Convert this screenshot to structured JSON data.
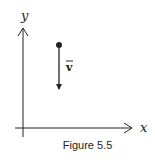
{
  "figure": {
    "caption": "Figure 5.5",
    "x_axis_label": "x",
    "y_axis_label": "y",
    "vector_label": "v",
    "vector_bar": "‾"
  },
  "colors": {
    "stroke": "#222222",
    "background": "#ffffff"
  },
  "geometry": {
    "origin": [
      23,
      128
    ],
    "x_axis_end": [
      132,
      128
    ],
    "y_axis_end": [
      23,
      28
    ],
    "point": [
      59,
      45
    ],
    "vector_end": [
      59,
      90
    ]
  }
}
